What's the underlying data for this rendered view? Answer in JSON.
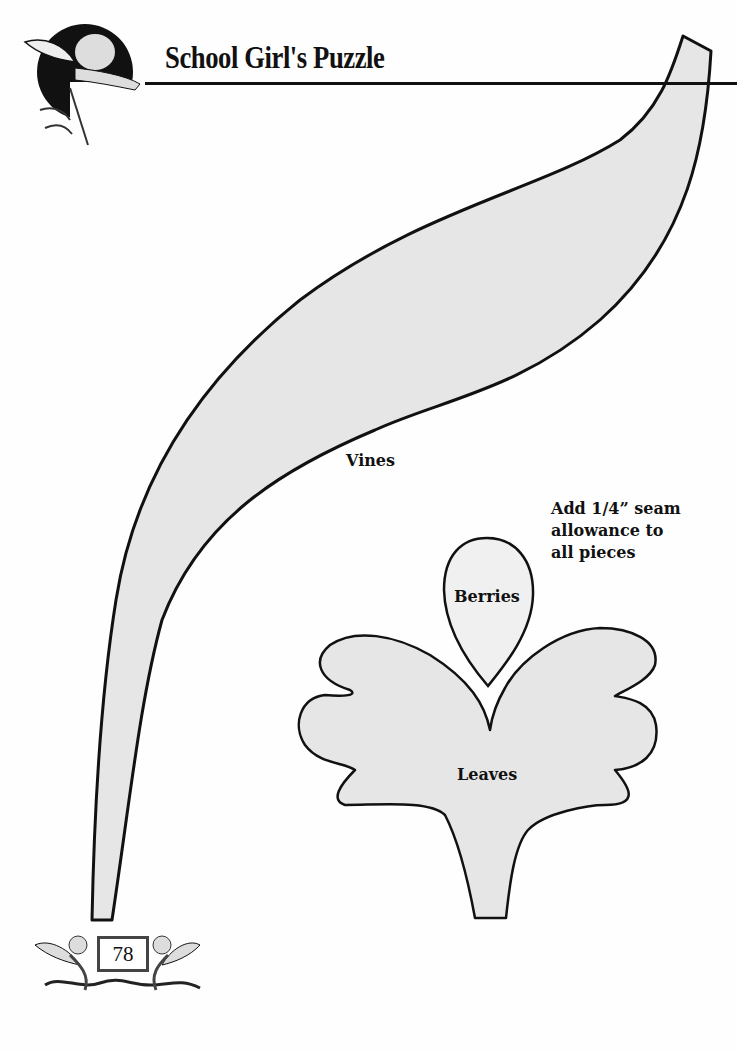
{
  "header": {
    "title": "School Girl's Puzzle",
    "emblem": "cherub-emblem-icon"
  },
  "pattern_pieces": [
    {
      "name": "Vines",
      "fill": "#e6e6e6"
    },
    {
      "name": "Berries",
      "fill": "#f0f0f0"
    },
    {
      "name": "Leaves",
      "fill": "#e6e6e6"
    }
  ],
  "note": {
    "lines": [
      "Add 1/4” seam",
      "allowance to",
      "all pieces"
    ]
  },
  "footer": {
    "page_number": "78",
    "ornament": "cherubs-ornament-icon"
  },
  "colors": {
    "outline": "#111111",
    "piece_fill": "#e6e6e6",
    "background": "#fefefe"
  }
}
